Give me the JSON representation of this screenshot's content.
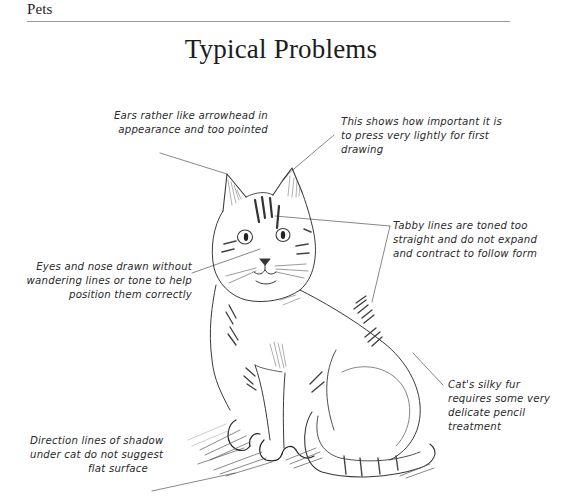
{
  "header": {
    "running_head": "Pets",
    "title": "Typical Problems"
  },
  "illustration": {
    "subject": "pencil sketch of a seated tabby cat",
    "icon": "cat-sketch-illustration"
  },
  "annotations": [
    {
      "id": "ears",
      "lines": [
        "Ears rather like arrowhead in",
        "appearance and too pointed"
      ]
    },
    {
      "id": "light-pressure",
      "lines": [
        "This shows how important it is",
        "to press very lightly for first",
        "drawing"
      ]
    },
    {
      "id": "tabby-lines",
      "lines": [
        "Tabby lines are toned too",
        "straight and do not expand",
        "and contract to follow form"
      ]
    },
    {
      "id": "eyes-nose",
      "lines": [
        "Eyes and nose drawn without",
        "wandering lines or tone to help",
        "position them correctly"
      ]
    },
    {
      "id": "silky-fur",
      "lines": [
        "Cat's silky fur",
        "requires some very",
        "delicate pencil",
        "treatment"
      ]
    },
    {
      "id": "shadow",
      "lines": [
        "Direction lines of shadow",
        "under cat do not suggest",
        "flat surface"
      ]
    }
  ],
  "colors": {
    "background": "#ffffff",
    "text": "#1c1c1c",
    "pencil": "#3a3a3a",
    "rule": "#9a9a9a"
  }
}
